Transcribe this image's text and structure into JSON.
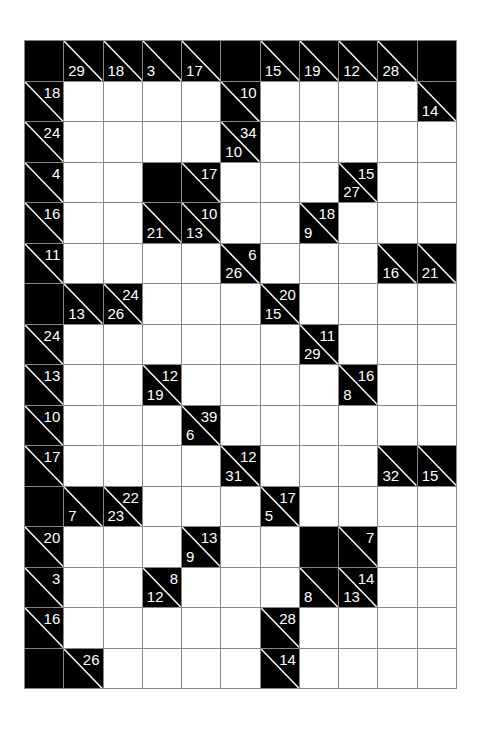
{
  "puzzle": {
    "type": "kakuro",
    "rows": 16,
    "cols": 11,
    "colors": {
      "clue_bg": "#000000",
      "clue_text": "#ffffff",
      "empty_cell": "#ffffff",
      "grid_line": "#888888"
    },
    "legend": {
      "across": "clue number at top-right (sum of cells to the right)",
      "down": "clue number at bottom-left (sum of cells below)"
    },
    "grid": [
      [
        [
          "B"
        ],
        [
          "C",
          null,
          29
        ],
        [
          "C",
          null,
          18
        ],
        [
          "C",
          null,
          3
        ],
        [
          "C",
          null,
          17
        ],
        [
          "B"
        ],
        [
          "C",
          null,
          15
        ],
        [
          "C",
          null,
          19
        ],
        [
          "C",
          null,
          12
        ],
        [
          "C",
          null,
          28
        ],
        [
          "B"
        ]
      ],
      [
        [
          "C",
          18,
          null
        ],
        [
          "W"
        ],
        [
          "W"
        ],
        [
          "W"
        ],
        [
          "W"
        ],
        [
          "C",
          10,
          null
        ],
        [
          "W"
        ],
        [
          "W"
        ],
        [
          "W"
        ],
        [
          "W"
        ],
        [
          "C",
          null,
          14
        ]
      ],
      [
        [
          "C",
          24,
          null
        ],
        [
          "W"
        ],
        [
          "W"
        ],
        [
          "W"
        ],
        [
          "W"
        ],
        [
          "C",
          34,
          10
        ],
        [
          "W"
        ],
        [
          "W"
        ],
        [
          "W"
        ],
        [
          "W"
        ],
        [
          "W"
        ]
      ],
      [
        [
          "C",
          4,
          null
        ],
        [
          "W"
        ],
        [
          "W"
        ],
        [
          "B"
        ],
        [
          "C",
          17,
          null
        ],
        [
          "W"
        ],
        [
          "W"
        ],
        [
          "W"
        ],
        [
          "C",
          15,
          27
        ],
        [
          "W"
        ],
        [
          "W"
        ]
      ],
      [
        [
          "C",
          16,
          null
        ],
        [
          "W"
        ],
        [
          "W"
        ],
        [
          "C",
          null,
          21
        ],
        [
          "C",
          10,
          13
        ],
        [
          "W"
        ],
        [
          "W"
        ],
        [
          "C",
          18,
          9
        ],
        [
          "W"
        ],
        [
          "W"
        ],
        [
          "W"
        ]
      ],
      [
        [
          "C",
          11,
          null
        ],
        [
          "W"
        ],
        [
          "W"
        ],
        [
          "W"
        ],
        [
          "W"
        ],
        [
          "C",
          6,
          26
        ],
        [
          "W"
        ],
        [
          "W"
        ],
        [
          "W"
        ],
        [
          "C",
          null,
          16
        ],
        [
          "C",
          null,
          21
        ]
      ],
      [
        [
          "B"
        ],
        [
          "C",
          null,
          13
        ],
        [
          "C",
          24,
          26
        ],
        [
          "W"
        ],
        [
          "W"
        ],
        [
          "W"
        ],
        [
          "C",
          20,
          15
        ],
        [
          "W"
        ],
        [
          "W"
        ],
        [
          "W"
        ],
        [
          "W"
        ]
      ],
      [
        [
          "C",
          24,
          null
        ],
        [
          "W"
        ],
        [
          "W"
        ],
        [
          "W"
        ],
        [
          "W"
        ],
        [
          "W"
        ],
        [
          "W"
        ],
        [
          "C",
          11,
          29
        ],
        [
          "W"
        ],
        [
          "W"
        ],
        [
          "W"
        ]
      ],
      [
        [
          "C",
          13,
          null
        ],
        [
          "W"
        ],
        [
          "W"
        ],
        [
          "C",
          12,
          19
        ],
        [
          "W"
        ],
        [
          "W"
        ],
        [
          "W"
        ],
        [
          "W"
        ],
        [
          "C",
          16,
          8
        ],
        [
          "W"
        ],
        [
          "W"
        ]
      ],
      [
        [
          "C",
          10,
          null
        ],
        [
          "W"
        ],
        [
          "W"
        ],
        [
          "W"
        ],
        [
          "C",
          39,
          6
        ],
        [
          "W"
        ],
        [
          "W"
        ],
        [
          "W"
        ],
        [
          "W"
        ],
        [
          "W"
        ],
        [
          "W"
        ]
      ],
      [
        [
          "C",
          17,
          null
        ],
        [
          "W"
        ],
        [
          "W"
        ],
        [
          "W"
        ],
        [
          "W"
        ],
        [
          "C",
          12,
          31
        ],
        [
          "W"
        ],
        [
          "W"
        ],
        [
          "W"
        ],
        [
          "C",
          null,
          32
        ],
        [
          "C",
          null,
          15
        ]
      ],
      [
        [
          "B"
        ],
        [
          "C",
          null,
          7
        ],
        [
          "C",
          22,
          23
        ],
        [
          "W"
        ],
        [
          "W"
        ],
        [
          "W"
        ],
        [
          "C",
          17,
          5
        ],
        [
          "W"
        ],
        [
          "W"
        ],
        [
          "W"
        ],
        [
          "W"
        ]
      ],
      [
        [
          "C",
          20,
          null
        ],
        [
          "W"
        ],
        [
          "W"
        ],
        [
          "W"
        ],
        [
          "C",
          13,
          9
        ],
        [
          "W"
        ],
        [
          "W"
        ],
        [
          "B"
        ],
        [
          "C",
          7,
          null
        ],
        [
          "W"
        ],
        [
          "W"
        ]
      ],
      [
        [
          "C",
          3,
          null
        ],
        [
          "W"
        ],
        [
          "W"
        ],
        [
          "C",
          8,
          12
        ],
        [
          "W"
        ],
        [
          "W"
        ],
        [
          "W"
        ],
        [
          "C",
          null,
          8
        ],
        [
          "C",
          14,
          13
        ],
        [
          "W"
        ],
        [
          "W"
        ]
      ],
      [
        [
          "C",
          16,
          null
        ],
        [
          "W"
        ],
        [
          "W"
        ],
        [
          "W"
        ],
        [
          "W"
        ],
        [
          "W"
        ],
        [
          "C",
          28,
          null
        ],
        [
          "W"
        ],
        [
          "W"
        ],
        [
          "W"
        ],
        [
          "W"
        ]
      ],
      [
        [
          "B"
        ],
        [
          "C",
          26,
          null
        ],
        [
          "W"
        ],
        [
          "W"
        ],
        [
          "W"
        ],
        [
          "W"
        ],
        [
          "C",
          14,
          null
        ],
        [
          "W"
        ],
        [
          "W"
        ],
        [
          "W"
        ],
        [
          "W"
        ]
      ]
    ]
  }
}
